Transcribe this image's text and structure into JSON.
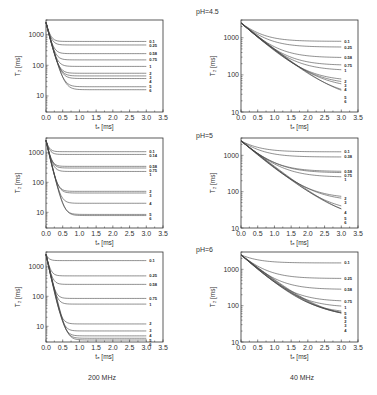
{
  "figure": {
    "column_labels": [
      "200 MHz",
      "40 MHz"
    ],
    "row_labels": [
      "pH=4.5",
      "pH=5",
      "pH=6"
    ],
    "xlabel": "t_E [ms]",
    "ylabel": "T_2 [ms]",
    "x_ticks": [
      "0.0",
      "0.5",
      "1.0",
      "1.5",
      "2.0",
      "2.5",
      "3.0",
      "3.5"
    ],
    "y_ticks": [
      "10",
      "100",
      "1000"
    ]
  },
  "chart_data": [
    {
      "type": "line",
      "panel": "200 MHz, pH=4.5",
      "xlabel": "t_E [ms]",
      "ylabel": "T_2 [ms]",
      "xlim": [
        0,
        3.5
      ],
      "ylim": [
        3,
        3000
      ],
      "yscale": "log",
      "start": 2500,
      "tau": 0.08,
      "series": [
        {
          "name": "0.1",
          "plateau": 600
        },
        {
          "name": "0.25",
          "plateau": 460
        },
        {
          "name": "0.58",
          "plateau": 240
        },
        {
          "name": "0.75",
          "plateau": 150
        },
        {
          "name": "1",
          "plateau": 92
        },
        {
          "name": "2",
          "plateau": 55
        },
        {
          "name": "3",
          "plateau": 45
        },
        {
          "name": "4",
          "plateau": 37
        },
        {
          "name": "5",
          "plateau": 20
        },
        {
          "name": "6",
          "plateau": 16
        }
      ]
    },
    {
      "type": "line",
      "panel": "40 MHz, pH=4.5",
      "xlabel": "t_E [ms]",
      "ylabel": "T_2 [ms]",
      "xlim": [
        0,
        3.5
      ],
      "ylim": [
        10,
        3000
      ],
      "yscale": "log",
      "start": 2500,
      "tau": 0.45,
      "series": [
        {
          "name": "0.1",
          "plateau": 800
        },
        {
          "name": "0.25",
          "plateau": 560
        },
        {
          "name": "0.58",
          "plateau": 290
        },
        {
          "name": "0.75",
          "plateau": 180
        },
        {
          "name": "1",
          "plateau": 130
        },
        {
          "name": "2",
          "plateau": 68
        },
        {
          "name": "3",
          "plateau": 55
        },
        {
          "name": "4",
          "plateau": 44
        },
        {
          "name": "5",
          "plateau": 25
        },
        {
          "name": "6",
          "plateau": 20
        }
      ]
    },
    {
      "type": "line",
      "panel": "200 MHz, pH=5",
      "xlabel": "t_E [ms]",
      "ylabel": "T_2 [ms]",
      "xlim": [
        0,
        3.5
      ],
      "ylim": [
        3,
        3000
      ],
      "yscale": "log",
      "start": 2500,
      "tau": 0.07,
      "series": [
        {
          "name": "0.1",
          "plateau": 1050
        },
        {
          "name": "0.14",
          "plateau": 850
        },
        {
          "name": "0.58",
          "plateau": 340
        },
        {
          "name": "0.75",
          "plateau": 300
        },
        {
          "name": "1",
          "plateau": 230
        },
        {
          "name": "2",
          "plateau": 50
        },
        {
          "name": "3",
          "plateau": 44
        },
        {
          "name": "4",
          "plateau": 20
        },
        {
          "name": "5",
          "plateau": 8.5
        },
        {
          "name": "6",
          "plateau": 7.8
        }
      ]
    },
    {
      "type": "line",
      "panel": "40 MHz, pH=5",
      "xlabel": "t_E [ms]",
      "ylabel": "T_2 [ms]",
      "xlim": [
        0,
        3.5
      ],
      "ylim": [
        10,
        3000
      ],
      "yscale": "log",
      "start": 2500,
      "tau": 0.45,
      "series": [
        {
          "name": "0.1",
          "plateau": 1250
        },
        {
          "name": "0.38",
          "plateau": 900
        },
        {
          "name": "0.58",
          "plateau": 360
        },
        {
          "name": "0.75",
          "plateau": 330
        },
        {
          "name": "1",
          "plateau": 250
        },
        {
          "name": "2",
          "plateau": 65
        },
        {
          "name": "3",
          "plateau": 55
        },
        {
          "name": "4",
          "plateau": 27
        },
        {
          "name": "5",
          "plateau": 18
        },
        {
          "name": "6",
          "plateau": 15
        }
      ]
    },
    {
      "type": "line",
      "panel": "200 MHz, pH=6",
      "xlabel": "t_E [ms]",
      "ylabel": "T_2 [ms]",
      "xlim": [
        0,
        3.5
      ],
      "ylim": [
        3,
        3000
      ],
      "yscale": "log",
      "start": 2500,
      "tau": 0.07,
      "series": [
        {
          "name": "0.1",
          "plateau": 1550
        },
        {
          "name": "0.25",
          "plateau": 480
        },
        {
          "name": "0.58",
          "plateau": 250
        },
        {
          "name": "0.75",
          "plateau": 85
        },
        {
          "name": "1",
          "plateau": 55
        },
        {
          "name": "2",
          "plateau": 12
        },
        {
          "name": "3",
          "plateau": 7
        },
        {
          "name": "4",
          "plateau": 4.8
        },
        {
          "name": "5",
          "plateau": 4
        },
        {
          "name": "6",
          "plateau": 3.5
        }
      ]
    },
    {
      "type": "line",
      "panel": "40 MHz, pH=6",
      "xlabel": "t_E [ms]",
      "ylabel": "T_2 [ms]",
      "xlim": [
        0,
        3.5
      ],
      "ylim": [
        10,
        3000
      ],
      "yscale": "log",
      "start": 2500,
      "tau": 0.45,
      "series": [
        {
          "name": "0.1",
          "plateau": 1500
        },
        {
          "name": "0.25",
          "plateau": 560
        },
        {
          "name": "0.58",
          "plateau": 280
        },
        {
          "name": "0.75",
          "plateau": 130
        },
        {
          "name": "1",
          "plateau": 90
        },
        {
          "name": "5",
          "plateau": 62
        },
        {
          "name": "6",
          "plateau": 55
        },
        {
          "name": "2",
          "plateau": 50
        },
        {
          "name": "3",
          "plateau": 47
        },
        {
          "name": "4",
          "plateau": 45
        }
      ]
    }
  ]
}
